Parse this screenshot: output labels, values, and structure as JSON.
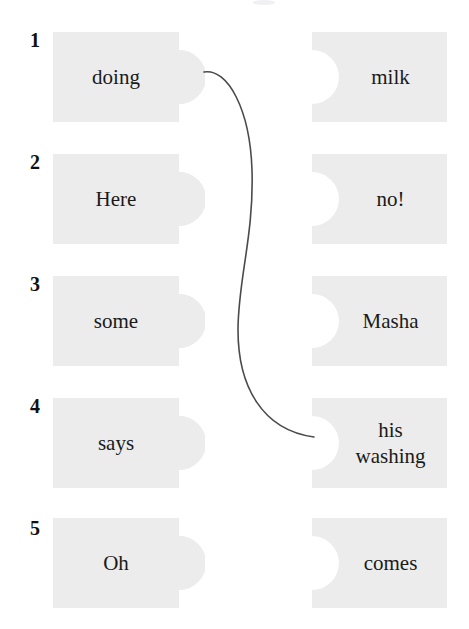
{
  "exercise": {
    "type": "matching-puzzle",
    "colors": {
      "page_background": "#ffffff",
      "piece_fill": "#ececec",
      "text": "#1a1a1a",
      "number": "#101010",
      "connector_line": "#4a4a4a"
    },
    "rows": [
      {
        "number": "1",
        "left": {
          "label": "doing"
        },
        "right": {
          "label": "milk"
        }
      },
      {
        "number": "2",
        "left": {
          "label": "Here"
        },
        "right": {
          "label": "no!"
        }
      },
      {
        "number": "3",
        "left": {
          "label": "some"
        },
        "right": {
          "label": "Masha"
        }
      },
      {
        "number": "4",
        "left": {
          "label": "says"
        },
        "right": {
          "label": "his\nwashing"
        }
      },
      {
        "number": "5",
        "left": {
          "label": "Oh"
        },
        "right": {
          "label": "comes"
        }
      }
    ],
    "connections": [
      {
        "from_row": "1",
        "from_side": "left",
        "from_label": "doing",
        "to_row": "4",
        "to_side": "right",
        "to_label": "his washing"
      }
    ]
  }
}
